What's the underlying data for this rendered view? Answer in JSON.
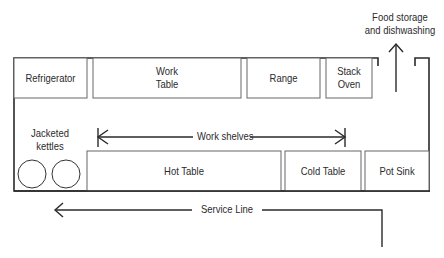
{
  "diagram": {
    "colors": {
      "line": "#2a2a2a",
      "box_line": "#555555",
      "background": "#ffffff"
    },
    "top_row": [
      {
        "id": "refrigerator",
        "label_lines": [
          "Refrigerator"
        ]
      },
      {
        "id": "work-table",
        "label_lines": [
          "Work",
          "Table"
        ]
      },
      {
        "id": "range",
        "label_lines": [
          "Range"
        ]
      },
      {
        "id": "stack-oven",
        "label_lines": [
          "Stack",
          "Oven"
        ]
      }
    ],
    "bottom_row": [
      {
        "id": "hot-table",
        "label_lines": [
          "Hot Table"
        ]
      },
      {
        "id": "cold-table",
        "label_lines": [
          "Cold Table"
        ]
      },
      {
        "id": "pot-sink",
        "label_lines": [
          "Pot Sink"
        ]
      }
    ],
    "kettles": {
      "label_lines": [
        "Jacketed",
        "kettles"
      ],
      "count": 2
    },
    "work_shelves": {
      "label": "Work shelves"
    },
    "exit": {
      "label_lines": [
        "Food storage",
        "and dishwashing"
      ],
      "direction": "up"
    },
    "service_line": {
      "label": "Service Line",
      "direction": "left"
    }
  }
}
